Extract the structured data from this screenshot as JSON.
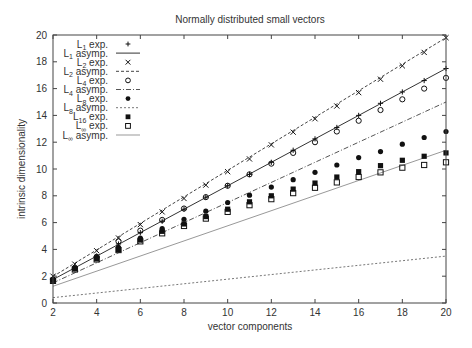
{
  "chart_data": {
    "type": "scatter",
    "title": "Normally distributed small vectors",
    "xlabel": "vector components",
    "ylabel": "intrinsic dimensionality",
    "xlim": [
      2,
      20
    ],
    "ylim": [
      0,
      20
    ],
    "xticks": [
      2,
      4,
      6,
      8,
      10,
      12,
      14,
      16,
      18,
      20
    ],
    "yticks": [
      0,
      2,
      4,
      6,
      8,
      10,
      12,
      14,
      16,
      18,
      20
    ],
    "grid": false,
    "legend_position": "upper left",
    "x": [
      2,
      3,
      4,
      5,
      6,
      7,
      8,
      9,
      10,
      11,
      12,
      13,
      14,
      15,
      16,
      17,
      18,
      19,
      20
    ],
    "series": [
      {
        "name": "L1 exp.",
        "sub": "1",
        "base": "L",
        "suffix": " exp.",
        "kind": "points",
        "marker": "plus",
        "values": [
          1.8,
          2.65,
          3.5,
          4.4,
          5.25,
          6.1,
          7.0,
          7.9,
          8.75,
          9.6,
          10.5,
          11.4,
          12.25,
          13.1,
          14.0,
          14.9,
          15.75,
          16.6,
          17.5
        ]
      },
      {
        "name": "L1 asymp.",
        "sub": "1",
        "base": "L",
        "suffix": " asymp.",
        "kind": "line",
        "style": "solid",
        "color": "#333333",
        "line": [
          [
            2,
            1.75
          ],
          [
            20,
            17.5
          ]
        ]
      },
      {
        "name": "L2 exp.",
        "sub": "2",
        "base": "L",
        "suffix": " exp.",
        "kind": "points",
        "marker": "cross",
        "values": [
          2.0,
          2.9,
          3.9,
          4.85,
          5.85,
          6.8,
          7.8,
          8.8,
          9.8,
          10.75,
          11.8,
          12.75,
          13.75,
          14.7,
          15.7,
          16.7,
          17.7,
          18.7,
          19.8
        ]
      },
      {
        "name": "L2 asymp.",
        "sub": "2",
        "base": "L",
        "suffix": " asymp.",
        "kind": "line",
        "style": "dashed",
        "color": "#444444",
        "line": [
          [
            2,
            1.98
          ],
          [
            20,
            19.8
          ]
        ]
      },
      {
        "name": "L4 exp.",
        "sub": "4",
        "base": "L",
        "suffix": " exp.",
        "kind": "points",
        "marker": "circle",
        "values": [
          1.75,
          2.6,
          3.45,
          4.6,
          5.4,
          6.2,
          7.05,
          7.9,
          8.75,
          9.6,
          10.4,
          11.2,
          12.0,
          12.8,
          13.6,
          14.4,
          15.2,
          16.0,
          16.8
        ]
      },
      {
        "name": "L4 asymp.",
        "sub": "4",
        "base": "L",
        "suffix": " asymp.",
        "kind": "line",
        "style": "dashdot",
        "color": "#555555",
        "line": [
          [
            2,
            1.5
          ],
          [
            20,
            15.0
          ]
        ]
      },
      {
        "name": "L8 exp.",
        "sub": "8",
        "base": "L",
        "suffix": " exp.",
        "kind": "points",
        "marker": "filled-circle",
        "values": [
          1.7,
          2.6,
          3.4,
          4.15,
          4.85,
          5.55,
          6.25,
          6.85,
          7.5,
          8.05,
          8.65,
          9.2,
          9.75,
          10.3,
          10.85,
          11.3,
          11.85,
          12.35,
          12.8
        ]
      },
      {
        "name": "L8 asymp.",
        "sub": "8",
        "base": "L",
        "suffix": " asymp.",
        "kind": "line",
        "style": "dotted",
        "color": "#777777",
        "line": [
          [
            2,
            0.4
          ],
          [
            20,
            3.5
          ]
        ]
      },
      {
        "name": "L16 exp.",
        "sub": "16",
        "base": "L",
        "suffix": " exp.",
        "kind": "points",
        "marker": "filled-square",
        "values": [
          1.7,
          2.55,
          3.3,
          4.0,
          4.7,
          5.35,
          5.9,
          6.45,
          7.0,
          7.55,
          8.0,
          8.5,
          8.95,
          9.4,
          9.8,
          10.25,
          10.65,
          10.95,
          11.2
        ]
      },
      {
        "name": "L∞ exp.",
        "sub": "∞",
        "base": "L",
        "suffix": " exp.",
        "kind": "points",
        "marker": "square",
        "values": [
          1.65,
          2.5,
          3.25,
          3.95,
          4.6,
          5.2,
          5.75,
          6.3,
          6.8,
          7.3,
          7.75,
          8.2,
          8.6,
          9.0,
          9.4,
          9.75,
          10.1,
          10.3,
          10.5
        ]
      },
      {
        "name": "L∞ asymp.",
        "sub": "∞",
        "base": "L",
        "suffix": " asymp.",
        "kind": "line",
        "style": "solid-light",
        "color": "#999999",
        "line": [
          [
            2,
            1.25
          ],
          [
            20,
            11.4
          ]
        ]
      }
    ]
  }
}
